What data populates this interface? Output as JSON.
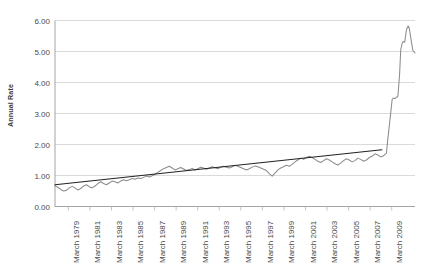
{
  "chart_data": {
    "type": "line",
    "title": "",
    "xlabel": "",
    "ylabel": "Annual Rate",
    "ylim": [
      0.0,
      6.0
    ],
    "ytick_step": 1.0,
    "ytick_labels": [
      "0.00",
      "1.00",
      "2.00",
      "3.00",
      "4.00",
      "5.00",
      "6.00"
    ],
    "ytick_values": [
      0.0,
      1.0,
      2.0,
      3.0,
      4.0,
      5.0,
      6.0
    ],
    "grid": "horizontal",
    "legend": "none",
    "categories": [
      "March 1979",
      "March 1981",
      "March 1983",
      "March 1985",
      "March 1987",
      "March 1989",
      "March 1991",
      "March 1993",
      "March 1995",
      "March 1997",
      "March 1999",
      "March 2001",
      "March 2003",
      "March 2005",
      "March 2007",
      "March 2009"
    ],
    "x_start_year": 1979,
    "x_end_year": 2010.5,
    "series": [
      {
        "name": "Annual Rate",
        "color": "#8c8c8c",
        "style": "jagged",
        "x": [
          1979.0,
          1979.25,
          1979.5,
          1979.75,
          1980.0,
          1980.25,
          1980.5,
          1980.75,
          1981.0,
          1981.25,
          1981.5,
          1981.75,
          1982.0,
          1982.25,
          1982.5,
          1982.75,
          1983.0,
          1983.25,
          1983.5,
          1983.75,
          1984.0,
          1984.25,
          1984.5,
          1984.75,
          1985.0,
          1985.25,
          1985.5,
          1985.75,
          1986.0,
          1986.25,
          1986.5,
          1986.75,
          1987.0,
          1987.25,
          1987.5,
          1987.75,
          1988.0,
          1988.25,
          1988.5,
          1988.75,
          1989.0,
          1989.25,
          1989.5,
          1989.75,
          1990.0,
          1990.25,
          1990.5,
          1990.75,
          1991.0,
          1991.25,
          1991.5,
          1991.75,
          1992.0,
          1992.25,
          1992.5,
          1992.75,
          1993.0,
          1993.25,
          1993.5,
          1993.75,
          1994.0,
          1994.25,
          1994.5,
          1994.75,
          1995.0,
          1995.25,
          1995.5,
          1995.75,
          1996.0,
          1996.25,
          1996.5,
          1996.75,
          1997.0,
          1997.25,
          1997.5,
          1997.75,
          1998.0,
          1998.25,
          1998.5,
          1998.75,
          1999.0,
          1999.25,
          1999.5,
          1999.75,
          2000.0,
          2000.25,
          2000.5,
          2000.75,
          2001.0,
          2001.25,
          2001.5,
          2001.75,
          2002.0,
          2002.25,
          2002.5,
          2002.75,
          2003.0,
          2003.25,
          2003.5,
          2003.75,
          2004.0,
          2004.25,
          2004.5,
          2004.75,
          2005.0,
          2005.25,
          2005.5,
          2005.75,
          2006.0,
          2006.25,
          2006.5,
          2006.75,
          2007.0,
          2007.25,
          2007.5,
          2007.75,
          2008.0,
          2008.1,
          2008.25,
          2008.4,
          2008.5,
          2008.6,
          2008.75,
          2008.85,
          2009.0,
          2009.15,
          2009.25,
          2009.4,
          2009.5,
          2009.6,
          2009.75,
          2009.9,
          2010.0,
          2010.15,
          2010.3,
          2010.5
        ],
        "y": [
          0.66,
          0.62,
          0.55,
          0.5,
          0.52,
          0.6,
          0.65,
          0.6,
          0.53,
          0.58,
          0.66,
          0.7,
          0.64,
          0.6,
          0.66,
          0.74,
          0.8,
          0.74,
          0.7,
          0.76,
          0.82,
          0.8,
          0.76,
          0.82,
          0.86,
          0.83,
          0.86,
          0.9,
          0.88,
          0.92,
          0.9,
          0.94,
          0.98,
          0.95,
          0.99,
          1.04,
          1.1,
          1.16,
          1.22,
          1.26,
          1.3,
          1.24,
          1.18,
          1.22,
          1.26,
          1.21,
          1.16,
          1.19,
          1.23,
          1.18,
          1.22,
          1.27,
          1.24,
          1.2,
          1.24,
          1.28,
          1.25,
          1.22,
          1.27,
          1.3,
          1.27,
          1.24,
          1.28,
          1.33,
          1.3,
          1.26,
          1.22,
          1.18,
          1.22,
          1.27,
          1.31,
          1.28,
          1.24,
          1.2,
          1.16,
          1.06,
          0.98,
          1.08,
          1.18,
          1.24,
          1.28,
          1.33,
          1.3,
          1.36,
          1.44,
          1.5,
          1.56,
          1.52,
          1.58,
          1.62,
          1.58,
          1.52,
          1.46,
          1.42,
          1.48,
          1.54,
          1.5,
          1.44,
          1.38,
          1.34,
          1.4,
          1.48,
          1.54,
          1.5,
          1.44,
          1.48,
          1.56,
          1.52,
          1.46,
          1.5,
          1.58,
          1.62,
          1.7,
          1.66,
          1.6,
          1.64,
          1.72,
          2.1,
          2.6,
          3.1,
          3.45,
          3.5,
          3.48,
          3.52,
          3.55,
          4.25,
          5.05,
          5.3,
          5.32,
          5.3,
          5.7,
          5.82,
          5.75,
          5.4,
          5.05,
          4.95
        ]
      },
      {
        "name": "Linear Trend",
        "color": "#222222",
        "style": "straight",
        "x": [
          1979.0,
          2007.6
        ],
        "y": [
          0.7,
          1.83
        ]
      }
    ]
  }
}
